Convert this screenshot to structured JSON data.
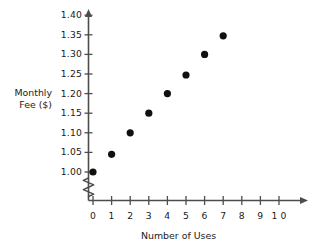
{
  "chart_data": {
    "type": "scatter",
    "title": "",
    "xlabel": "Number of Uses",
    "ylabel": "Monthly\nFee ($)",
    "ylabel_line1": "Monthly",
    "ylabel_line2": "Fee ($)",
    "x": [
      0,
      1,
      2,
      3,
      4,
      5,
      6,
      7
    ],
    "values": [
      1.0,
      1.045,
      1.1,
      1.15,
      1.2,
      1.2475,
      1.3,
      1.3475
    ],
    "points": [
      {
        "x": 0,
        "y": 1.0
      },
      {
        "x": 1,
        "y": 1.045
      },
      {
        "x": 2,
        "y": 1.1
      },
      {
        "x": 3,
        "y": 1.15
      },
      {
        "x": 4,
        "y": 1.2
      },
      {
        "x": 5,
        "y": 1.2475
      },
      {
        "x": 6,
        "y": 1.3
      },
      {
        "x": 7,
        "y": 1.3475
      }
    ],
    "xlim": [
      0,
      10
    ],
    "ylim": [
      1.0,
      1.4
    ],
    "xticks": [
      0,
      1,
      2,
      3,
      4,
      5,
      6,
      7,
      8,
      9,
      10
    ],
    "xtick_labels": [
      "0",
      "1",
      "2",
      "3",
      "4",
      "5",
      "6",
      "7",
      "8",
      "9",
      "1 0"
    ],
    "yticks": [
      1.0,
      1.05,
      1.1,
      1.15,
      1.2,
      1.25,
      1.3,
      1.35,
      1.4
    ],
    "ytick_labels": [
      "1.00",
      "1.05",
      "1.10",
      "1.15",
      "1.20",
      "1.25",
      "1.30",
      "1.35",
      "1.40"
    ],
    "grid": false,
    "legend": null,
    "y_axis_break": true,
    "axis_arrows": true,
    "marker_color": "#111111",
    "axis_color": "#4d4d4d",
    "background_color": "#ffffff"
  }
}
